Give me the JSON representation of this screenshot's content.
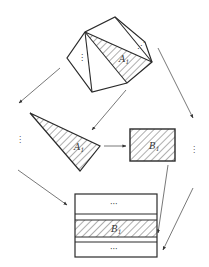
{
  "diagram": {
    "type": "decomposition-flow",
    "colors": {
      "stroke": "#2a2a2a",
      "arrow": "#555555",
      "hatch": "#333333",
      "background": "#ffffff"
    },
    "polygon": {
      "vertices": [
        [
          115,
          17
        ],
        [
          145,
          42
        ],
        [
          152,
          62
        ],
        [
          127,
          83
        ],
        [
          92,
          92
        ],
        [
          67,
          58
        ],
        [
          85,
          32
        ]
      ],
      "diagonals": [
        [
          [
            85,
            32
          ],
          [
            92,
            92
          ]
        ],
        [
          [
            85,
            32
          ],
          [
            127,
            83
          ]
        ],
        [
          [
            85,
            32
          ],
          [
            152,
            62
          ]
        ],
        [
          [
            115,
            17
          ],
          [
            152,
            62
          ]
        ]
      ],
      "hatched_triangle": [
        [
          85,
          32
        ],
        [
          152,
          62
        ],
        [
          127,
          83
        ]
      ],
      "label": "A",
      "label_sub": "1",
      "dots_left": "⋮",
      "dots_right": "⋰"
    },
    "triangle": {
      "vertices": [
        [
          30,
          113
        ],
        [
          100,
          146
        ],
        [
          80,
          171
        ]
      ],
      "label": "A",
      "label_sub": "1"
    },
    "rect": {
      "x": 130,
      "y": 129,
      "w": 45,
      "h": 32,
      "label": "B",
      "label_sub": "1"
    },
    "stack": {
      "x": 75,
      "y": 194,
      "w": 82,
      "h": 63,
      "lines": [
        214,
        220,
        237,
        242
      ],
      "top_dots": "···",
      "bottom_dots": "···",
      "label": "B",
      "label_sub": "1"
    },
    "side_dots": {
      "left": "⋮",
      "right": "⋮"
    },
    "arrows": [
      {
        "from": [
          60,
          68
        ],
        "to": [
          19,
          103
        ]
      },
      {
        "from": [
          126,
          90
        ],
        "to": [
          92,
          130
        ]
      },
      {
        "from": [
          158,
          48
        ],
        "to": [
          193,
          118
        ]
      },
      {
        "from": [
          104,
          146
        ],
        "to": [
          126,
          146
        ]
      },
      {
        "from": [
          18,
          170
        ],
        "to": [
          67,
          205
        ]
      },
      {
        "from": [
          168,
          165
        ],
        "to": [
          158,
          233
        ]
      },
      {
        "from": [
          193,
          188
        ],
        "to": [
          163,
          250
        ]
      }
    ]
  }
}
